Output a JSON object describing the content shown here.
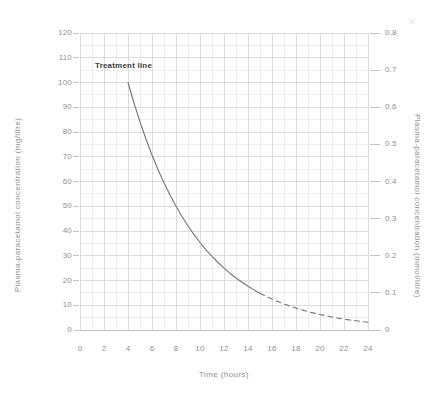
{
  "colors": {
    "background": "#ffffff",
    "grid_minor": "#ededed",
    "grid_major": "#dcdcdc",
    "axis_line": "#c2c2c2",
    "tick_mark": "#c2c2c2",
    "tick_text": "#8f8f8f",
    "curve": "#757575",
    "annotation_text": "#3d3d3d",
    "artifact": "#d6d6d6"
  },
  "chart_data": {
    "type": "line",
    "title": "",
    "xlabel": "Time (hours)",
    "ylabel": "Plasma-paracetamol concentration (mg/litre)",
    "ylabel_right": "Plasma-paracetamol concentration (mmol/litre)",
    "xlim": [
      0,
      24
    ],
    "ylim": [
      0,
      120
    ],
    "ylim_right": [
      0,
      0.8
    ],
    "x_ticks": [
      0,
      2,
      4,
      6,
      8,
      10,
      12,
      14,
      16,
      18,
      20,
      22,
      24
    ],
    "y_ticks_left": [
      0,
      10,
      20,
      30,
      40,
      50,
      60,
      70,
      80,
      90,
      100,
      110,
      120
    ],
    "y_ticks_right": [
      0,
      0.1,
      0.2,
      0.3,
      0.4,
      0.5,
      0.6,
      0.7,
      0.8
    ],
    "grid": {
      "on": true,
      "minor_x_step_hours": 1,
      "major_x_step_hours": 2,
      "minor_y_step_mg": 5,
      "major_y_step_mg": 10
    },
    "legend": "none",
    "annotation": {
      "text": "Treatment line",
      "anchor_x_hours": 4,
      "anchor_y_mg_per_litre": 100
    },
    "series": [
      {
        "name": "Treatment line",
        "solid_range_hours": [
          4,
          15
        ],
        "dashed_range_hours": [
          15,
          24
        ],
        "x_hours": [
          4,
          4.5,
          5,
          5.5,
          6,
          6.5,
          7,
          7.5,
          8,
          8.5,
          9,
          9.5,
          10,
          10.5,
          11,
          11.5,
          12,
          12.5,
          13,
          13.5,
          14,
          14.5,
          15,
          15.5,
          16,
          16.5,
          17,
          17.5,
          18,
          18.5,
          19,
          19.5,
          20,
          20.5,
          21,
          21.5,
          22,
          22.5,
          23,
          23.5,
          24
        ],
        "y_mg_per_litre": [
          100,
          91.7,
          84.09,
          77.11,
          70.71,
          64.84,
          59.46,
          54.53,
          50,
          45.85,
          42.04,
          38.55,
          35.36,
          32.42,
          29.73,
          27.26,
          25,
          22.92,
          21.02,
          19.28,
          17.68,
          16.21,
          14.87,
          13.63,
          12.5,
          11.46,
          10.51,
          9.64,
          8.84,
          8.11,
          7.43,
          6.82,
          6.25,
          5.73,
          5.26,
          4.82,
          4.42,
          4.05,
          3.72,
          3.41,
          3.13
        ]
      }
    ]
  }
}
